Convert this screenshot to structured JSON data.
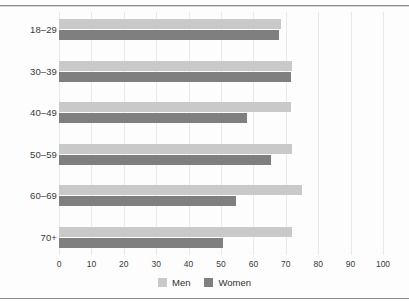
{
  "chart_data": {
    "type": "bar",
    "orientation": "horizontal",
    "title": "",
    "xlabel": "",
    "ylabel": "",
    "categories": [
      "18–29",
      "30–39",
      "40–49",
      "50–59",
      "60–69",
      "70+"
    ],
    "series": [
      {
        "name": "Men",
        "color": "#c9c9c9",
        "values": [
          68.5,
          72,
          71.5,
          72,
          75,
          72
        ]
      },
      {
        "name": "Women",
        "color": "#7f7f7f",
        "values": [
          68,
          71.5,
          58,
          65.5,
          54.5,
          50.5
        ]
      }
    ],
    "xlim": [
      0,
      100
    ],
    "xticks": [
      0,
      10,
      20,
      30,
      40,
      50,
      60,
      70,
      80,
      90,
      100
    ],
    "xtick_labels": [
      "0",
      "10",
      "20",
      "30",
      "40",
      "50",
      "60",
      "70",
      "80",
      "90",
      "100"
    ],
    "grid": "vertical",
    "legend_position": "bottom-center"
  },
  "legend": {
    "items": [
      {
        "label": "Men",
        "color": "#c9c9c9"
      },
      {
        "label": "Women",
        "color": "#7f7f7f"
      }
    ]
  },
  "colors": {
    "men": "#c9c9c9",
    "women": "#7f7f7f",
    "gridline": "#e9e9e9",
    "rule": "#8a8a8a",
    "text": "#3a3a3a",
    "background": "#ffffff"
  }
}
